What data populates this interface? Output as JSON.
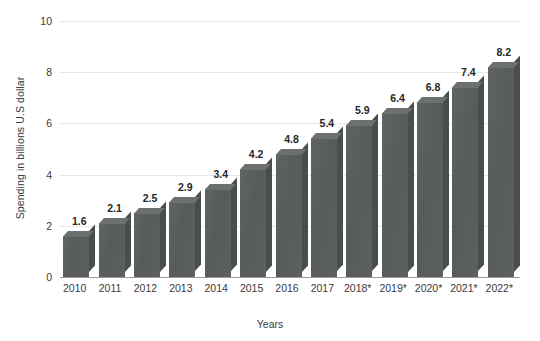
{
  "chart_data": {
    "type": "bar",
    "title": "",
    "subtitle": "",
    "xlabel": "Years",
    "ylabel": "Spending in billions U.S dollar",
    "categories": [
      "2010",
      "2011",
      "2012",
      "2013",
      "2014",
      "2015",
      "2016",
      "2017",
      "2018*",
      "2019*",
      "2020*",
      "2021*",
      "2022*"
    ],
    "values": [
      1.6,
      2.1,
      2.5,
      2.9,
      3.4,
      4.2,
      4.8,
      5.4,
      5.9,
      6.4,
      6.8,
      7.4,
      8.2
    ],
    "value_labels": [
      "1.6",
      "2.1",
      "2.5",
      "2.9",
      "3.4",
      "4.2",
      "4.8",
      "5.4",
      "5.9",
      "6.4",
      "6.8",
      "7.4",
      "8.2"
    ],
    "ylim": [
      0,
      10
    ],
    "yticks": [
      0,
      2,
      4,
      6,
      8,
      10
    ],
    "ytick_labels": [
      "0",
      "2",
      "4",
      "6",
      "8",
      "10"
    ],
    "grid": true,
    "legend": null,
    "legend_position": "none",
    "series": [
      {
        "name": "Spending",
        "values": [
          1.6,
          2.1,
          2.5,
          2.9,
          3.4,
          4.2,
          4.8,
          5.4,
          5.9,
          6.4,
          6.8,
          7.4,
          8.2
        ]
      }
    ],
    "annotations": [],
    "style": {
      "bar_color": "#5b5e5e",
      "bar_top_color": "#6d7070",
      "bar_side_color": "#4a4d4d",
      "grid_color": "#e8e8e8",
      "axis_color": "#9a9a9a",
      "text_color": "#3a3a3a",
      "value_label_color": "#262626",
      "background": "#ffffff",
      "three_d": true
    }
  }
}
